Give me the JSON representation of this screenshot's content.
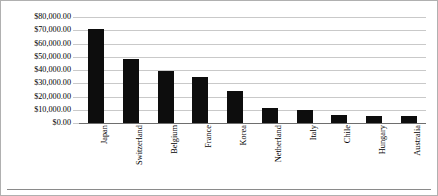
{
  "chart_data": {
    "type": "bar",
    "title": "",
    "xlabel": "",
    "ylabel": "",
    "ylim": [
      0,
      80000
    ],
    "grid": true,
    "legend": "none",
    "bar_color": "#0d0d0d",
    "gridline_color": "#c9c9c9",
    "axis_color": "#6e6e6e",
    "ytick_labels": [
      "$80,000.00",
      "$70,000.00",
      "$60,000.00",
      "$50,000.00",
      "$40,000.00",
      "$30,000.00",
      "$20,000.00",
      "$10,000.00",
      "$0.00"
    ],
    "ytick_values": [
      80000,
      70000,
      60000,
      50000,
      40000,
      30000,
      20000,
      10000,
      0
    ],
    "categories": [
      "Japan",
      "Switzerland",
      "Belgium",
      "France",
      "Korea",
      "Netherland",
      "Italy",
      "Chile",
      "Hungary",
      "Australia"
    ],
    "values": [
      71000,
      48000,
      39000,
      35000,
      24000,
      11000,
      9500,
      6000,
      5000,
      5000
    ]
  }
}
